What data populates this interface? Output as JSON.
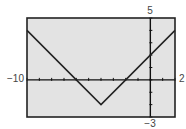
{
  "chart_data": {
    "type": "line",
    "title": "",
    "xlabel": "",
    "ylabel": "",
    "xlim": [
      -10,
      2
    ],
    "ylim": [
      -3,
      5
    ],
    "x_tick_step": 1,
    "y_tick_step": 1,
    "grid": false,
    "legend": null,
    "function": "f(x) = |x + 4| - 2",
    "series": [
      {
        "name": "f(x)",
        "x": [
          -10,
          -6,
          -4,
          -2,
          0,
          2
        ],
        "y": [
          4,
          0,
          -2,
          0,
          2,
          4
        ]
      }
    ],
    "window_labels": {
      "xmin": "−10",
      "xmax": "2",
      "ymax": "5",
      "ymin": "−3"
    },
    "colors": {
      "plot_background": "#e3e3e3",
      "frame": "#222222",
      "axes": "#111111",
      "curve": "#222222"
    }
  }
}
